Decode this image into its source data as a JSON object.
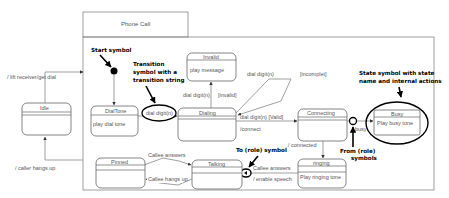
{
  "diagram": {
    "title": "Phone Call",
    "states": [
      {
        "id": "idle",
        "name": "Idle",
        "action": ""
      },
      {
        "id": "dialtone",
        "name": "DialTone",
        "action": "play dial tone"
      },
      {
        "id": "invalid",
        "name": "Invalid",
        "action": "play message"
      },
      {
        "id": "dialing",
        "name": "Dialing",
        "action": ""
      },
      {
        "id": "connecting",
        "name": "Connecting",
        "action": ""
      },
      {
        "id": "busy",
        "name": "Busy",
        "action": "Play busy tone"
      },
      {
        "id": "ringing",
        "name": "ringing",
        "action": "Play ringing tone"
      },
      {
        "id": "talking",
        "name": "Talking",
        "action": ""
      },
      {
        "id": "pinned",
        "name": "Pinned",
        "action": ""
      }
    ],
    "transitions": {
      "lift_receiver": "/ lift receiver/get dial",
      "caller_hangs_up": "/ caller hangs up",
      "dial_digit_dialtone": "dial digit(n)",
      "dial_digit_invalid": "dial digit(n)",
      "invalid_guard": "[invalid]",
      "dial_digit_loop": "dial digit(n)",
      "incomplete_guard": "[incomplet]",
      "dial_digit_valid": "dial digit(n)  [Valid]",
      "connect_action": "/connect",
      "busy": "busy",
      "connected": "/ connected",
      "callee_answers_ringing": "Callee answers",
      "enable_speech": "/ enable speech",
      "callee_answers_pinned": "Callee answers",
      "callee_hangs_up": "Callee hangs up"
    },
    "annotations": {
      "start_symbol": "Start symbol",
      "transition_symbol_l1": "Transition",
      "transition_symbol_l2": "symbol with a",
      "transition_symbol_l3": "transition string",
      "state_symbol_l1": "State symbol with state",
      "state_symbol_l2": "name and internal actions",
      "from_role_l1": "From (role)",
      "from_role_l2": "symbols",
      "to_role": "To (role) symbol"
    }
  }
}
